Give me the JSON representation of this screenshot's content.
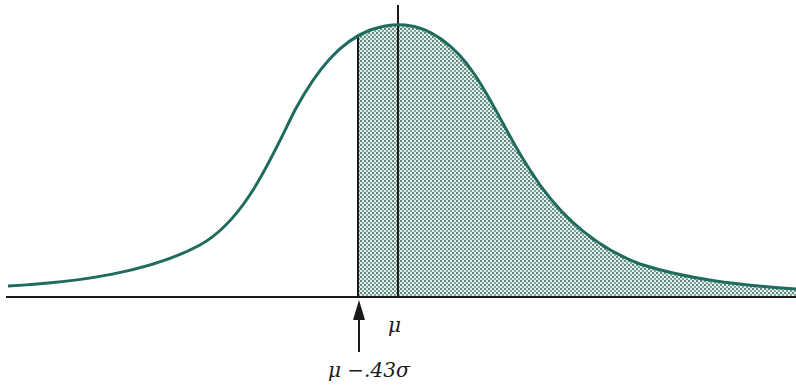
{
  "figure": {
    "type": "skewed-distribution-diagram",
    "curve_color": "#1f6b5e",
    "shade_color": "#9fbcb5",
    "axis_color": "#1a1a1a",
    "labels": {
      "mean": "μ",
      "threshold": "μ −.43σ"
    },
    "shaded_region": "area under curve to the right of μ −.43σ"
  }
}
